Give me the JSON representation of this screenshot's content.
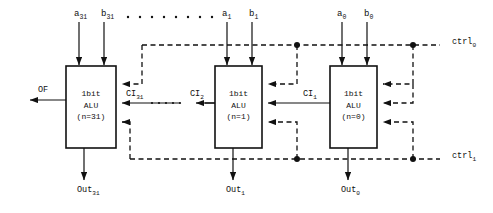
{
  "diagram": {
    "type": "block-diagram",
    "colors": {
      "stroke": "#111111",
      "background": "#ffffff",
      "text": "#111111"
    },
    "blocks": [
      {
        "id": "alu31",
        "line1": "1bit",
        "line2": "ALU",
        "line3": "(n=31)",
        "x": 66,
        "y": 66,
        "w": 50,
        "h": 82
      },
      {
        "id": "alu1",
        "line1": "1bit",
        "line2": "ALU",
        "line3": "(n=1)",
        "x": 215,
        "y": 66,
        "w": 47,
        "h": 82
      },
      {
        "id": "alu0",
        "line1": "1bit",
        "line2": "ALU",
        "line3": "(n=0)",
        "x": 330,
        "y": 66,
        "w": 47,
        "h": 82
      }
    ],
    "inputs_top": [
      {
        "id": "a31",
        "base": "a",
        "sub": "31",
        "x": 74,
        "y": 10
      },
      {
        "id": "b31",
        "base": "b",
        "sub": "31",
        "x": 101,
        "y": 10
      },
      {
        "id": "a1",
        "base": "a",
        "sub": "1",
        "x": 222,
        "y": 10
      },
      {
        "id": "b1",
        "base": "b",
        "sub": "1",
        "x": 249,
        "y": 10
      },
      {
        "id": "a0",
        "base": "a",
        "sub": "0",
        "x": 337,
        "y": 10
      },
      {
        "id": "b0",
        "base": "b",
        "sub": "0",
        "x": 364,
        "y": 10
      }
    ],
    "outputs_bottom": [
      {
        "id": "out31",
        "base": "Out",
        "sub": "31",
        "x": 77,
        "y": 186
      },
      {
        "id": "out1",
        "base": "Out",
        "sub": "1",
        "x": 226,
        "y": 186
      },
      {
        "id": "out0",
        "base": "Out",
        "sub": "0",
        "x": 341,
        "y": 186
      }
    ],
    "carry_labels": [
      {
        "id": "ci31",
        "base": "CI",
        "sub": "31",
        "x": 126,
        "y": 90
      },
      {
        "id": "ci2",
        "base": "CI",
        "sub": "2",
        "x": 190,
        "y": 90
      },
      {
        "id": "ci1",
        "base": "CI",
        "sub": "1",
        "x": 303,
        "y": 90
      }
    ],
    "overflow_label": {
      "id": "of",
      "text": "OF",
      "x": 38,
      "y": 86
    },
    "control_rails": [
      {
        "id": "ctrl0",
        "base": "ctrl",
        "sub": "0",
        "x": 452,
        "y": 38,
        "rail_y": 45
      },
      {
        "id": "ctrl1",
        "base": "ctrl",
        "sub": "1",
        "x": 452,
        "y": 152,
        "rail_y": 159
      }
    ],
    "ellipsis_top": {
      "count": 8,
      "x_start": 128,
      "x_step": 12,
      "y": 17
    },
    "ellipsis_carry": {
      "count": 5,
      "x_start": 152,
      "x_step": 7,
      "y": 102
    }
  }
}
